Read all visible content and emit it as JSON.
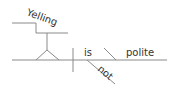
{
  "diagram": {
    "type": "sentence-diagram",
    "words": {
      "subject": "Yelling",
      "verb": "is",
      "modifier": "not",
      "complement": "polite"
    },
    "colors": {
      "line": "#8a8a8a",
      "text": "#333333",
      "background": "#ffffff"
    }
  }
}
